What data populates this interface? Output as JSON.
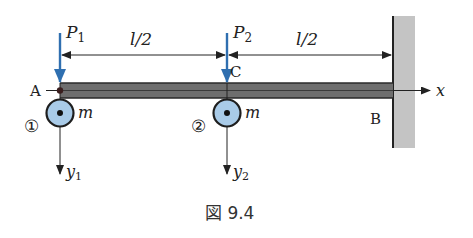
{
  "figure": {
    "caption": "図 9.4",
    "colors": {
      "force_arrow": "#2f6fb0",
      "mass_fill": "#a9cbe8",
      "beam_fill": "#6e6e6e",
      "wall_fill": "#c4c4c4",
      "line": "#222222"
    },
    "labels": {
      "P1": "P",
      "P1_sub": "1",
      "P2": "P",
      "P2_sub": "2",
      "dim_left": "l/2",
      "dim_right": "l/2",
      "point_A": "A",
      "point_B": "B",
      "point_C": "C",
      "x_axis": "x",
      "y1": "y",
      "y1_sub": "1",
      "y2": "y",
      "y2_sub": "2",
      "mass1": "m",
      "mass2": "m",
      "mass1_id": "①",
      "mass2_id": "②"
    }
  }
}
